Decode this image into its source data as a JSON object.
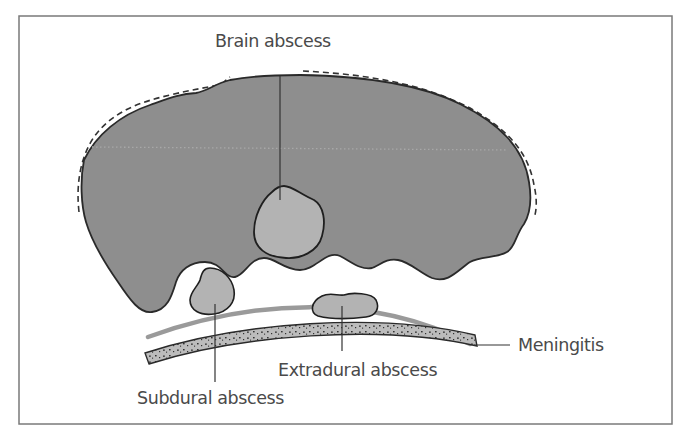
{
  "diagram": {
    "type": "anatomical-cross-section",
    "labels": {
      "brain_abscess": "Brain abscess",
      "meningitis": "Meningitis",
      "extradural_abscess": "Extradural abscess",
      "subdural_abscess": "Subdural abscess"
    },
    "colors": {
      "frame": "#7a7a7a",
      "brain_fill": "#8e8e8e",
      "abscess_fill": "#b3b3b3",
      "outline": "#2a2a2a",
      "meninges": "#9a9a9a",
      "skull_fill": "#b8b8b8",
      "text": "#4a4a4a",
      "background": "#ffffff"
    }
  }
}
